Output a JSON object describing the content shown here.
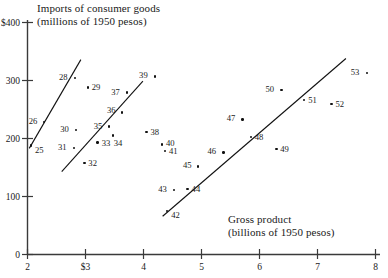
{
  "chart_data": {
    "type": "scatter",
    "title": "",
    "ylabel": "Imports of consumer goods\n(millions of 1950 pesos)",
    "ylabel_line1": "Imports of consumer goods",
    "ylabel_line2": "(millions of 1950 pesos)",
    "xlabel_line1": "Gross product",
    "xlabel_line2": "(billions of 1950 pesos)",
    "xlim": [
      2,
      8
    ],
    "ylim": [
      0,
      400
    ],
    "grid": false,
    "legend": false,
    "xticks": [
      {
        "value": 2,
        "label": "2"
      },
      {
        "value": 3,
        "label": "$3"
      },
      {
        "value": 4,
        "label": "4"
      },
      {
        "value": 5,
        "label": "5"
      },
      {
        "value": 6,
        "label": "6"
      },
      {
        "value": 7,
        "label": "7"
      },
      {
        "value": 8,
        "label": "8"
      }
    ],
    "yticks": [
      {
        "value": 400,
        "label": "$400"
      },
      {
        "value": 300,
        "label": "300"
      },
      {
        "value": 200,
        "label": "200"
      },
      {
        "value": 100,
        "label": "100"
      },
      {
        "value": 0,
        "label": "0"
      }
    ],
    "points": [
      {
        "label": "25",
        "x": 2.06,
        "y": 188,
        "lx": 4,
        "ly": 6
      },
      {
        "label": "26",
        "x": 2.28,
        "y": 228,
        "lx": -15,
        "ly": 0
      },
      {
        "label": "28",
        "x": 2.82,
        "y": 304,
        "lx": -16,
        "ly": 0
      },
      {
        "label": "29",
        "x": 3.04,
        "y": 288,
        "lx": 4,
        "ly": 1
      },
      {
        "label": "30",
        "x": 2.84,
        "y": 215,
        "lx": -16,
        "ly": 0
      },
      {
        "label": "31",
        "x": 2.8,
        "y": 184,
        "lx": -16,
        "ly": 0
      },
      {
        "label": "32",
        "x": 2.98,
        "y": 158,
        "lx": 4,
        "ly": 1
      },
      {
        "label": "33",
        "x": 3.21,
        "y": 193,
        "lx": 4,
        "ly": 1
      },
      {
        "label": "34",
        "x": 3.47,
        "y": 205,
        "lx": 1,
        "ly": 8
      },
      {
        "label": "35",
        "x": 3.4,
        "y": 221,
        "lx": -15,
        "ly": 1
      },
      {
        "label": "36",
        "x": 3.63,
        "y": 245,
        "lx": -15,
        "ly": -1
      },
      {
        "label": "37",
        "x": 3.72,
        "y": 279,
        "lx": -16,
        "ly": 0
      },
      {
        "label": "38",
        "x": 4.05,
        "y": 211,
        "lx": 4,
        "ly": 1
      },
      {
        "label": "39",
        "x": 4.2,
        "y": 307,
        "lx": -16,
        "ly": 0
      },
      {
        "label": "40",
        "x": 4.32,
        "y": 190,
        "lx": 4,
        "ly": 0
      },
      {
        "label": "41",
        "x": 4.37,
        "y": 178,
        "lx": 4,
        "ly": 1
      },
      {
        "label": "42",
        "x": 4.41,
        "y": 75,
        "lx": 4,
        "ly": 5
      },
      {
        "label": "43",
        "x": 4.53,
        "y": 111,
        "lx": -16,
        "ly": 0
      },
      {
        "label": "44",
        "x": 4.76,
        "y": 113,
        "lx": 4,
        "ly": 1
      },
      {
        "label": "45",
        "x": 4.94,
        "y": 152,
        "lx": -15,
        "ly": 0
      },
      {
        "label": "46",
        "x": 5.38,
        "y": 176,
        "lx": -16,
        "ly": 0
      },
      {
        "label": "47",
        "x": 5.71,
        "y": 233,
        "lx": -16,
        "ly": 0
      },
      {
        "label": "48",
        "x": 5.85,
        "y": 203,
        "lx": 4,
        "ly": 1
      },
      {
        "label": "49",
        "x": 6.29,
        "y": 182,
        "lx": 4,
        "ly": 1
      },
      {
        "label": "50",
        "x": 6.38,
        "y": 284,
        "lx": -16,
        "ly": 0
      },
      {
        "label": "51",
        "x": 6.77,
        "y": 266,
        "lx": 4,
        "ly": 1
      },
      {
        "label": "52",
        "x": 7.24,
        "y": 260,
        "lx": 4,
        "ly": 1
      },
      {
        "label": "53",
        "x": 7.85,
        "y": 313,
        "lx": -16,
        "ly": 0
      }
    ],
    "trend_lines": [
      {
        "name": "segment-1",
        "x1": 2.03,
        "y1": 183,
        "x2": 2.92,
        "y2": 336
      },
      {
        "name": "segment-2",
        "x1": 2.59,
        "y1": 143,
        "x2": 3.99,
        "y2": 299
      },
      {
        "name": "segment-3",
        "x1": 4.33,
        "y1": 66,
        "x2": 7.49,
        "y2": 338
      }
    ]
  }
}
